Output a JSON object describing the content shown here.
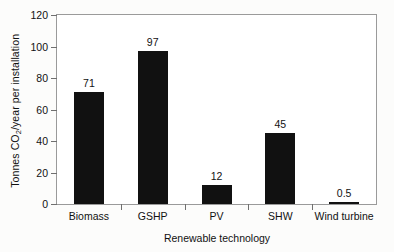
{
  "chart_data": {
    "type": "bar",
    "title": "",
    "categories": [
      "Biomass",
      "GSHP",
      "PV",
      "SHW",
      "Wind turbine"
    ],
    "values": [
      71,
      97,
      12,
      45,
      0.5
    ],
    "value_labels": [
      "71",
      "97",
      "12",
      "45",
      "0.5"
    ],
    "xlabel": "Renewable technology",
    "ylabel_text": "Tonnes CO",
    "ylabel_sub": "2",
    "ylabel_tail": "/year per installation",
    "ylabel_plain": "Tonnes CO2/year per installation",
    "ylim": [
      0,
      120
    ],
    "yticks": [
      0,
      20,
      40,
      60,
      80,
      100,
      120
    ],
    "ytick_labels": [
      "0",
      "20",
      "40",
      "60",
      "80",
      "100",
      "120"
    ],
    "grid": false,
    "legend": false,
    "bar_color": "#111111",
    "frame_color": "#9a9a9a",
    "background": "#ffffff"
  }
}
